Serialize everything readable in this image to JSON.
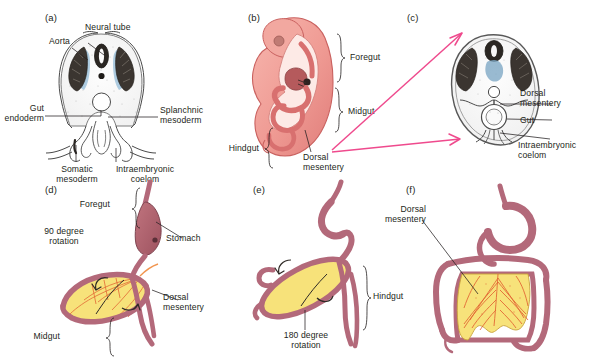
{
  "figure": {
    "background": "#ffffff",
    "accent_arrow_color": "#ef4a8d",
    "mesentery_color": "#f7e27a",
    "gut_tube_color": "#b3697a",
    "embryo_color": "#ef9a93",
    "neural_tube_color": "#5a8fb5"
  },
  "panels": [
    {
      "id": "a",
      "label": "(a)",
      "caption": "Transverse section of early embryo showing gut endoderm, somatic and splanchnic mesoderm",
      "labels": [
        {
          "name": "aorta",
          "text": "Aorta"
        },
        {
          "name": "neural-tube",
          "text": "Neural tube"
        },
        {
          "name": "gut-endoderm",
          "text": "Gut\nendoderm"
        },
        {
          "name": "splanchnic-mesoderm",
          "text": "Splanchnic\nmesoderm"
        },
        {
          "name": "somatic-mesoderm",
          "text": "Somatic\nmesoderm"
        },
        {
          "name": "intraembryonic-coelom",
          "text": "Intraembryonic\ncoelom"
        }
      ]
    },
    {
      "id": "b",
      "label": "(b)",
      "caption": "Sagittal view of curled embryo showing regions of the primitive gut tube",
      "labels": [
        {
          "name": "foregut",
          "text": "Foregut"
        },
        {
          "name": "midgut",
          "text": "Midgut"
        },
        {
          "name": "hindgut",
          "text": "Hindgut"
        },
        {
          "name": "dorsal-mesentery",
          "text": "Dorsal\nmesentery"
        }
      ]
    },
    {
      "id": "c",
      "label": "(c)",
      "caption": "Transverse section after lateral folding, gut suspended by dorsal mesentery",
      "labels": [
        {
          "name": "dorsal-mesentery",
          "text": "Dorsal\nmesentery"
        },
        {
          "name": "gut",
          "text": "Gut"
        },
        {
          "name": "intraembryonic-coelom",
          "text": "Intraembryonic\ncoelom"
        }
      ]
    },
    {
      "id": "d",
      "label": "(d)",
      "caption": "Midgut loop undergoing first rotation about the superior mesenteric artery",
      "labels": [
        {
          "name": "foregut",
          "text": "Foregut"
        },
        {
          "name": "stomach",
          "text": "Stomach"
        },
        {
          "name": "rotation-90",
          "text": "90 degree\nrotation"
        },
        {
          "name": "midgut",
          "text": "Midgut"
        },
        {
          "name": "dorsal-mesentery",
          "text": "Dorsal\nmesentery"
        }
      ]
    },
    {
      "id": "e",
      "label": "(e)",
      "caption": "Midgut loop completing further rotation",
      "labels": [
        {
          "name": "rotation-180",
          "text": "180 degree\nrotation"
        },
        {
          "name": "hindgut",
          "text": "Hindgut"
        }
      ]
    },
    {
      "id": "f",
      "label": "(f)",
      "caption": "Definitive position of intestines with fan-shaped dorsal mesentery",
      "labels": [
        {
          "name": "dorsal-mesentery",
          "text": "Dorsal\nmesentery"
        }
      ]
    }
  ]
}
